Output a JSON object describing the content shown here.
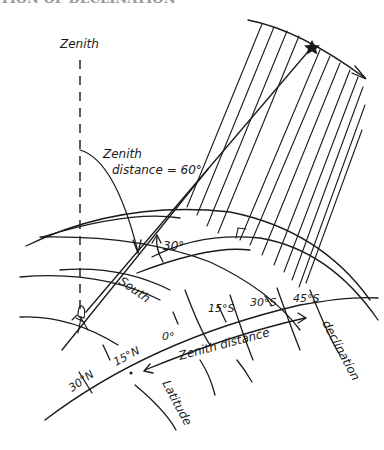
{
  "header": {
    "cut_title": "TION OF DECLINATION"
  },
  "labels": {
    "zenith": "Zenith",
    "zenith_distance_line1": "Zenith",
    "zenith_distance_line2": "distance = 60°",
    "angle": "30°",
    "south": "South",
    "lat_0": "0°",
    "lat_15s": "15°S",
    "lat_30s": "30°S",
    "lat_45s": "45°S",
    "lat_15n": "15°N",
    "lat_30n": "30°N",
    "zenith_distance_arrow": "Zenith distance",
    "declination": "declination",
    "latitude": "Latitude"
  },
  "colors": {
    "ink": "#1a1a1a",
    "background": "#ffffff"
  }
}
